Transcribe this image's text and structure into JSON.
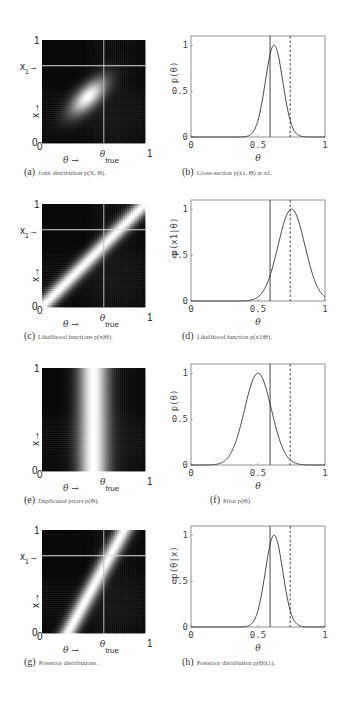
{
  "figure": {
    "panels": [
      {
        "id": "a",
        "tag": "(a)",
        "caption": "Joint distribution p(X, Θ).",
        "type": "heatmap"
      },
      {
        "id": "b",
        "tag": "(b)",
        "caption": "Cross-section p(x1, Θ) at x1.",
        "type": "line"
      },
      {
        "id": "c",
        "tag": "(c)",
        "caption": "Likelihood functions p(x|Θ).",
        "type": "heatmap"
      },
      {
        "id": "d",
        "tag": "(d)",
        "caption": "Likelihood function p(x1|Θ).",
        "type": "line"
      },
      {
        "id": "e",
        "tag": "(e)",
        "caption": "Duplicated priors p(Θ).",
        "type": "heatmap"
      },
      {
        "id": "f",
        "tag": "(f)",
        "caption": "Prior p(Θ).",
        "type": "line"
      },
      {
        "id": "g",
        "tag": "(g)",
        "caption": "Posterior distributions .",
        "type": "heatmap"
      },
      {
        "id": "h",
        "tag": "(h)",
        "caption": "Posterior distribution p(Θ|x1).",
        "type": "line"
      }
    ],
    "heatmap_labels": {
      "y_top": "1",
      "y_bottom": "0",
      "x_left": "0",
      "x_right": "1",
      "x1_label": "x",
      "x1_sub": "1",
      "x1_arrow": "→",
      "x_axis_arrow": "θ →",
      "theta_true": "θ",
      "theta_true_sub": "true",
      "y_axis_arrow": "x→"
    },
    "line_labels": {
      "xticks": [
        "0",
        "0.5",
        "1"
      ],
      "yticks": [
        "0",
        "0.5",
        "1"
      ],
      "xlabel": "θ",
      "ylabel_b": "p(θ)",
      "ylabel_d": "p(x1|θ)",
      "ylabel_f": "p(θ)",
      "ylabel_h": "p(θ|x)"
    }
  },
  "chart_data": [
    {
      "panel": "a",
      "type": "heatmap",
      "title": "Joint distribution p(X, Θ)",
      "xlabel": "θ",
      "ylabel": "x",
      "xlim": [
        0,
        1
      ],
      "ylim": [
        0,
        1
      ],
      "description": "Bright elliptical blob tilted along the diagonal, centered near (0.45,0.45)",
      "x1": 0.75,
      "theta_true": 0.6
    },
    {
      "panel": "b",
      "type": "line",
      "title": "Cross-section p(x1, Θ) at x1",
      "xlabel": "θ",
      "ylabel": "p(θ)",
      "xlim": [
        0,
        1
      ],
      "ylim": [
        0,
        1.1
      ],
      "series": [
        {
          "name": "cross-section",
          "peak_x": 0.62,
          "peak_y": 1.0,
          "sigma": 0.065
        }
      ],
      "vlines": [
        {
          "x": 0.59,
          "style": "solid"
        },
        {
          "x": 0.74,
          "style": "dashed"
        }
      ]
    },
    {
      "panel": "c",
      "type": "heatmap",
      "title": "Likelihood functions p(x|Θ)",
      "xlabel": "θ",
      "ylabel": "x",
      "xlim": [
        0,
        1
      ],
      "ylim": [
        0,
        1
      ],
      "description": "Bright diagonal band along x = θ",
      "x1": 0.75,
      "theta_true": 0.6
    },
    {
      "panel": "d",
      "type": "line",
      "title": "Likelihood function p(x1|Θ)",
      "xlabel": "θ",
      "ylabel": "p(x1|θ)",
      "xlim": [
        0,
        1
      ],
      "ylim": [
        0,
        1.1
      ],
      "series": [
        {
          "name": "likelihood",
          "peak_x": 0.75,
          "peak_y": 1.0,
          "sigma": 0.1
        }
      ],
      "vlines": [
        {
          "x": 0.59,
          "style": "solid"
        },
        {
          "x": 0.74,
          "style": "dashed"
        }
      ]
    },
    {
      "panel": "e",
      "type": "heatmap",
      "title": "Duplicated priors p(Θ)",
      "xlabel": "θ",
      "ylabel": "x",
      "xlim": [
        0,
        1
      ],
      "ylim": [
        0,
        1
      ],
      "description": "Bright vertical band centered at θ = 0.5"
    },
    {
      "panel": "f",
      "type": "line",
      "title": "Prior p(Θ)",
      "xlabel": "θ",
      "ylabel": "p(θ)",
      "xlim": [
        0,
        1
      ],
      "ylim": [
        0,
        1.1
      ],
      "series": [
        {
          "name": "prior",
          "peak_x": 0.5,
          "peak_y": 1.0,
          "sigma": 0.1
        }
      ],
      "vlines": [
        {
          "x": 0.59,
          "style": "solid"
        },
        {
          "x": 0.74,
          "style": "dashed"
        }
      ]
    },
    {
      "panel": "g",
      "type": "heatmap",
      "title": "Posterior distributions",
      "xlabel": "θ",
      "ylabel": "x",
      "xlim": [
        0,
        1
      ],
      "ylim": [
        0,
        1
      ],
      "description": "Bright steep diagonal band from (0.25,0) to (0.8,1)",
      "x1": 0.75,
      "theta_true": 0.6
    },
    {
      "panel": "h",
      "type": "line",
      "title": "Posterior distribution p(Θ|x1)",
      "xlabel": "θ",
      "ylabel": "p(θ|x)",
      "xlim": [
        0,
        1
      ],
      "ylim": [
        0,
        1.1
      ],
      "series": [
        {
          "name": "posterior",
          "peak_x": 0.62,
          "peak_y": 1.0,
          "sigma": 0.065
        }
      ],
      "vlines": [
        {
          "x": 0.59,
          "style": "solid"
        },
        {
          "x": 0.74,
          "style": "dashed"
        }
      ]
    }
  ]
}
